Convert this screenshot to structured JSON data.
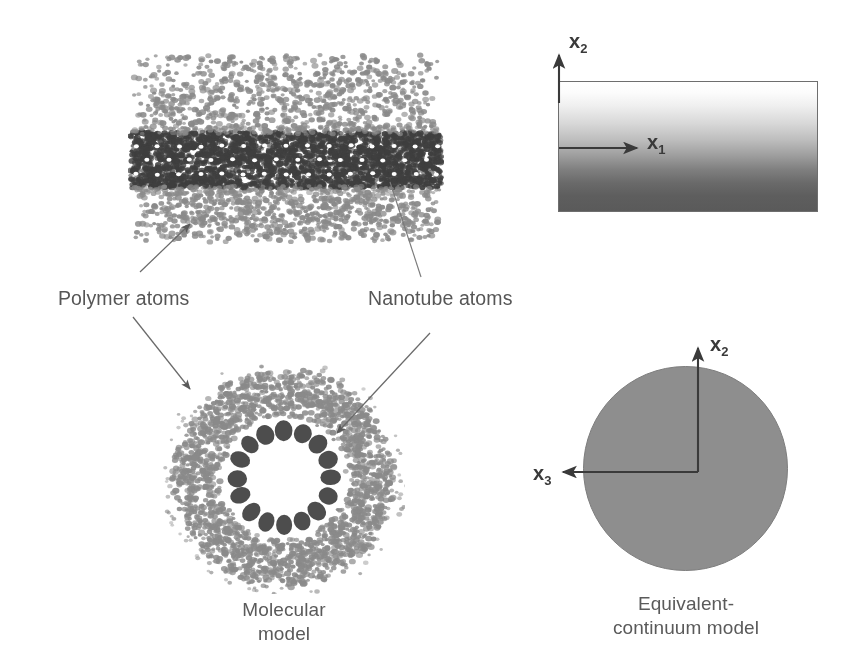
{
  "figure": {
    "background_color": "#ffffff",
    "ink_color": "#565656",
    "dark_atom_color": "#3f3f3f",
    "light_atom_color": "#8a8a8a",
    "continuum_fill_color": "#8e8e8e"
  },
  "annotations": {
    "polymer_atoms_label": "Polymer atoms",
    "nanotube_atoms_label": "Nanotube atoms"
  },
  "captions": {
    "molecular_model": "Molecular\nmodel",
    "equivalent_continuum_model": "Equivalent-\ncontinuum model"
  },
  "axes": {
    "cylinder_vertical": {
      "symbol": "x",
      "subscript": "2"
    },
    "cylinder_horizontal": {
      "symbol": "x",
      "subscript": "1"
    },
    "circle_vertical": {
      "symbol": "x",
      "subscript": "2"
    },
    "circle_horizontal": {
      "symbol": "x",
      "subscript": "3"
    }
  },
  "panels": {
    "molecular_side_view": "molecular-model-side-view",
    "molecular_cross_section": "molecular-model-cross-section",
    "continuum_side_view": "equivalent-continuum-cylinder",
    "continuum_cross_section": "equivalent-continuum-circle"
  }
}
